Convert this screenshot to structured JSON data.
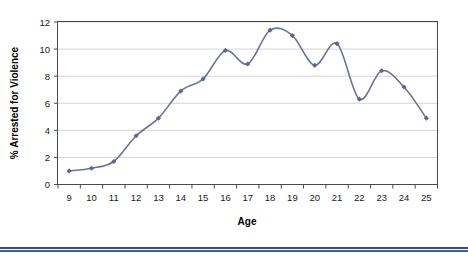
{
  "chart_data": {
    "type": "line",
    "title": "",
    "xlabel": "Age",
    "ylabel": "% Arrested for Violence",
    "x": [
      9,
      10,
      11,
      12,
      13,
      14,
      15,
      16,
      17,
      18,
      19,
      20,
      21,
      22,
      23,
      24,
      25
    ],
    "categories": [
      "9",
      "10",
      "11",
      "12",
      "13",
      "14",
      "15",
      "16",
      "17",
      "18",
      "19",
      "20",
      "21",
      "22",
      "23",
      "24",
      "25"
    ],
    "values": [
      1.0,
      1.2,
      1.7,
      3.6,
      4.9,
      6.9,
      7.8,
      9.9,
      8.9,
      11.4,
      11.0,
      8.8,
      10.4,
      6.3,
      8.4,
      7.2,
      4.9
    ],
    "series": [
      {
        "name": "% Arrested for Violence",
        "values": [
          1.0,
          1.2,
          1.7,
          3.6,
          4.9,
          6.9,
          7.8,
          9.9,
          8.9,
          11.4,
          11.0,
          8.8,
          10.4,
          6.3,
          8.4,
          7.2,
          4.9
        ],
        "color": "#6b7399",
        "marker": "diamond",
        "smoothed": true
      }
    ],
    "xlim": [
      8.5,
      25.5
    ],
    "ylim": [
      0,
      12
    ],
    "yticks": [
      0,
      2,
      4,
      6,
      8,
      10,
      12
    ],
    "ytick_labels": [
      "0",
      "2",
      "4",
      "6",
      "8",
      "10",
      "12"
    ],
    "xticks": [
      9,
      10,
      11,
      12,
      13,
      14,
      15,
      16,
      17,
      18,
      19,
      20,
      21,
      22,
      23,
      24,
      25
    ],
    "grid": "horizontal",
    "legend": "none",
    "legend_position": "none",
    "annotations": []
  },
  "colors": {
    "line": "#6b7399",
    "marker": "#5d6590",
    "gridline": "#c9c9c9",
    "frame": "#4a4a4a",
    "text": "#1a1a1a",
    "divider": "#2f4f8f",
    "background": "#ffffff"
  }
}
